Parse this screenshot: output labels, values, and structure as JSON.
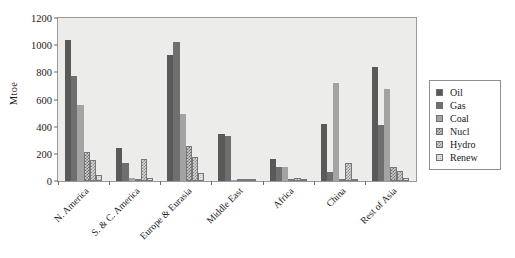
{
  "chart_data": {
    "type": "bar",
    "title": "",
    "xlabel": "",
    "ylabel": "Mtoe",
    "ylim": [
      0,
      1200
    ],
    "yticks": [
      0,
      200,
      400,
      600,
      800,
      1000,
      1200
    ],
    "grid": false,
    "legend_position": "right-outside",
    "categories": [
      "N. America",
      "S. & C. America",
      "Europe & Eurasia",
      "Middle East",
      "Africa",
      "China",
      "Rest of Asia"
    ],
    "series": [
      {
        "name": "Oil",
        "color": "#595959",
        "values": [
          1040,
          245,
          925,
          345,
          160,
          420,
          840
        ]
      },
      {
        "name": "Gas",
        "color": "#6f6f6f",
        "values": [
          770,
          130,
          1025,
          330,
          100,
          65,
          415
        ]
      },
      {
        "name": "Coal",
        "color": "#a3a3a3",
        "values": [
          560,
          25,
          490,
          10,
          105,
          725,
          680
        ]
      },
      {
        "name": "Nucl",
        "color": "#cfcfcf",
        "values": [
          215,
          5,
          255,
          0,
          3,
          15,
          105
        ]
      },
      {
        "name": "Hydro",
        "color": "#d8d8d8",
        "values": [
          155,
          160,
          180,
          3,
          25,
          130,
          75
        ]
      },
      {
        "name": "Renew",
        "color": "#e2e2e2",
        "values": [
          45,
          20,
          60,
          2,
          8,
          10,
          20
        ]
      }
    ]
  },
  "legend": {
    "items": [
      {
        "label": "Oil"
      },
      {
        "label": "Gas"
      },
      {
        "label": "Coal"
      },
      {
        "label": "Nucl"
      },
      {
        "label": "Hydro"
      },
      {
        "label": "Renew"
      }
    ]
  }
}
